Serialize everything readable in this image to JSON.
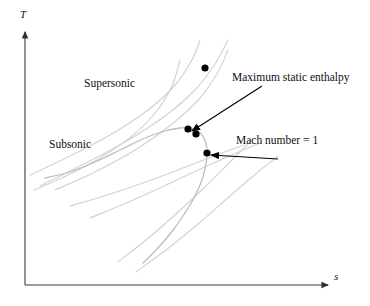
{
  "figure": {
    "type": "ts-diagram",
    "background_color": "#ffffff",
    "axes": {
      "y_label": "T",
      "x_label": "s",
      "axis_color": "#404040",
      "origin": {
        "x": 25,
        "y": 285
      },
      "y_top": {
        "x": 25,
        "y": 30
      },
      "x_right": {
        "x": 330,
        "y": 285
      }
    },
    "region_labels": [
      {
        "name": "supersonic",
        "text": "Supersonic"
      },
      {
        "name": "subsonic",
        "text": "Subsonic"
      }
    ],
    "annotations": [
      {
        "name": "maximum-static-enthalpy",
        "text": "Maximum static enthalpy",
        "arrow_from": {
          "x": 262,
          "y": 86
        },
        "arrow_to": {
          "x": 192,
          "y": 131
        }
      },
      {
        "name": "mach-number-one",
        "text": "Mach number = 1",
        "arrow_from": {
          "x": 278,
          "y": 159
        },
        "arrow_to": {
          "x": 211,
          "y": 155
        }
      }
    ],
    "markers": [
      {
        "name": "marker-upper-isolated",
        "x": 205,
        "y": 68,
        "r": 3.6,
        "color": "#000000"
      },
      {
        "name": "marker-max-enthalpy-left",
        "x": 188,
        "y": 129,
        "r": 3.6,
        "color": "#000000"
      },
      {
        "name": "marker-max-enthalpy-right",
        "x": 196,
        "y": 134,
        "r": 3.6,
        "color": "#000000"
      },
      {
        "name": "marker-mach-one",
        "x": 207,
        "y": 153,
        "r": 3.6,
        "color": "#000000"
      }
    ],
    "curves": {
      "main_curve_color": "#b9b9b9",
      "isoline_color": "#d2d2d2",
      "main_curve_label": "rayleigh-line",
      "isoline_label": "isentropic-family-line"
    }
  },
  "chart_data": {
    "type": "line",
    "title": "",
    "xlabel": "s",
    "ylabel": "T",
    "grid": false,
    "legend": "none",
    "annotations": [
      "Supersonic",
      "Subsonic",
      "Maximum static enthalpy",
      "Mach number = 1"
    ],
    "series": [
      {
        "name": "rayleigh-line-subsonic-branch",
        "points": [
          [
            45,
            178
          ],
          [
            70,
            172
          ],
          [
            95,
            162
          ],
          [
            120,
            150
          ],
          [
            145,
            138
          ],
          [
            165,
            131
          ],
          [
            180,
            128
          ],
          [
            190,
            128
          ],
          [
            198,
            131
          ],
          [
            204,
            138
          ],
          [
            207,
            148
          ]
        ]
      },
      {
        "name": "rayleigh-line-supersonic-branch",
        "points": [
          [
            207,
            153
          ],
          [
            206,
            164
          ],
          [
            202,
            180
          ],
          [
            194,
            198
          ],
          [
            183,
            216
          ],
          [
            170,
            234
          ],
          [
            156,
            250
          ],
          [
            143,
            263
          ]
        ]
      },
      {
        "name": "isoline-1",
        "points": [
          [
            40,
            186
          ],
          [
            80,
            166
          ],
          [
            125,
            142
          ],
          [
            165,
            116
          ],
          [
            195,
            90
          ],
          [
            215,
            64
          ],
          [
            228,
            40
          ]
        ]
      },
      {
        "name": "isoline-2",
        "points": [
          [
            55,
            190
          ],
          [
            95,
            172
          ],
          [
            135,
            150
          ],
          [
            172,
            124
          ],
          [
            200,
            98
          ],
          [
            218,
            72
          ],
          [
            228,
            50
          ]
        ]
      },
      {
        "name": "isoline-3",
        "points": [
          [
            30,
            175
          ],
          [
            70,
            156
          ],
          [
            110,
            135
          ],
          [
            148,
            110
          ],
          [
            176,
            84
          ],
          [
            193,
            58
          ],
          [
            200,
            40
          ]
        ]
      },
      {
        "name": "isoline-4",
        "points": [
          [
            34,
            190
          ],
          [
            66,
            176
          ],
          [
            100,
            158
          ],
          [
            132,
            136
          ],
          [
            156,
            112
          ],
          [
            172,
            86
          ],
          [
            180,
            60
          ]
        ]
      },
      {
        "name": "isoline-5",
        "points": [
          [
            118,
            262
          ],
          [
            146,
            240
          ],
          [
            176,
            214
          ],
          [
            206,
            186
          ],
          [
            232,
            160
          ],
          [
            252,
            140
          ]
        ]
      },
      {
        "name": "isoline-6",
        "points": [
          [
            136,
            272
          ],
          [
            166,
            250
          ],
          [
            198,
            224
          ],
          [
            230,
            196
          ],
          [
            258,
            172
          ],
          [
            278,
            156
          ]
        ]
      },
      {
        "name": "isoline-7",
        "points": [
          [
            90,
            218
          ],
          [
            124,
            204
          ],
          [
            160,
            188
          ],
          [
            198,
            170
          ],
          [
            234,
            154
          ],
          [
            262,
            142
          ]
        ]
      },
      {
        "name": "isoline-8",
        "points": [
          [
            70,
            206
          ],
          [
            104,
            196
          ],
          [
            140,
            184
          ],
          [
            178,
            170
          ],
          [
            214,
            156
          ],
          [
            244,
            145
          ]
        ]
      }
    ]
  }
}
